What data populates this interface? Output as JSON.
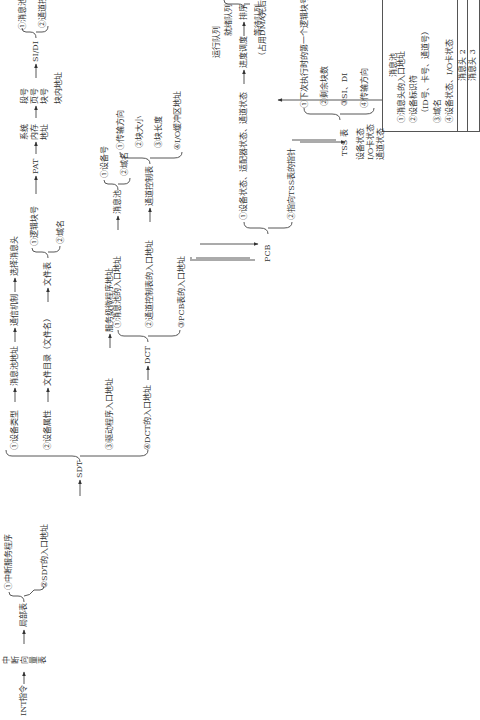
{
  "diagram": {
    "start": "INT指令",
    "interrupt_vector_table": [
      "中",
      "断",
      "向",
      "量",
      "表"
    ],
    "local_table": "局部表",
    "local_items": [
      "①中断服务程序",
      "②SDT的入口地址"
    ],
    "sdt_arrow_label": "②SDT的入口地址",
    "sdt": "SDT",
    "sdt_items": {
      "item1": "①设备类型",
      "item1_chain": [
        "消息池地址",
        "通信机制",
        "选择消息头"
      ],
      "item2": "②设备属性",
      "item2_chain": [
        "文件目录（文件名）",
        "文件表"
      ],
      "file_table_items": [
        "①逻辑块号",
        "②域名"
      ],
      "pat": "PAT",
      "sys_mem_addr": [
        "系统",
        "内存",
        "地址"
      ],
      "seg_page_block": [
        "段号",
        "页号",
        "块号"
      ],
      "in_block_addr": "块内地址",
      "sidi": "SI/DI",
      "sidi_items": [
        "①消息池",
        "②通道控制表"
      ],
      "item3": "③驱动程序入口地址",
      "item3_chain": [
        "服务级微程序地址"
      ],
      "item4": "④DCT的入口地址"
    },
    "dct": "DCT",
    "dct_items": {
      "item1": "①消息池的入口地址",
      "item1_target": "消息池",
      "msgpool_items": [
        "①设备号",
        "②域名"
      ],
      "item2": "②通道控制表的入口地址",
      "item2_target": "通道控制表",
      "channel_items": [
        "①传输方向",
        "②块大小",
        "③块长度",
        "④I/O缓冲区地址"
      ],
      "item3": "③PCB表的入口地址"
    },
    "pcb": "PCB",
    "pcb_items": {
      "item1": "①设备状态、适配器状态、通道状态",
      "item1_chain": [
        "进度调度",
        "排序"
      ],
      "queues": [
        "运行队列",
        "就绪队列",
        "等待队列"
      ],
      "dma_note": "（占用DMA先后次序）",
      "item2": "②指向TSS表的指针"
    },
    "tss": "TSS 表",
    "tss_items": [
      "①下次执行时的第一个逻辑块号",
      "②剩余块数",
      "③SI、DI",
      "④传输方向"
    ],
    "status_labels": [
      "设备状态",
      "I/O卡状态",
      "通道状态"
    ],
    "message_pool": {
      "title": "消息池",
      "head1_items": [
        "①消息头的入口地址",
        "②设备标识符",
        "（ID号、卡号、通道号）",
        "③域名",
        "④设备状态、I/O卡状态"
      ],
      "rows": [
        "消息头 2",
        "消息头 3",
        "…"
      ]
    },
    "line_color": "#333333"
  }
}
